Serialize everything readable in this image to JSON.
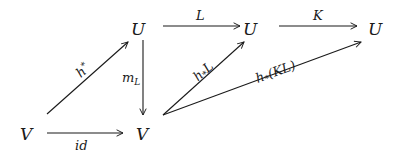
{
  "diagram": {
    "type": "commutative-diagram",
    "nodes": {
      "U_left": "𝒰",
      "U_mid": "𝒰",
      "U_right": "𝒰",
      "V_left": "𝒱",
      "V_mid": "𝒱"
    },
    "node_fallback": {
      "U": "U",
      "V": "V"
    },
    "arrows": {
      "h_star": {
        "from": "V_left",
        "to": "U_left",
        "label": "h",
        "sup": "*"
      },
      "m_L": {
        "from": "U_left",
        "to": "V_mid",
        "label": "m",
        "sub": "L"
      },
      "L": {
        "from": "U_left",
        "to": "U_mid",
        "label": "L"
      },
      "K": {
        "from": "U_mid",
        "to": "U_right",
        "label": "K"
      },
      "h_L": {
        "from": "V_mid",
        "to": "U_mid",
        "label": "h",
        "sub": "*",
        "tail": "L"
      },
      "h_KL": {
        "from": "V_mid",
        "to": "U_right",
        "label": "h",
        "sub": "*",
        "tail": "(KL)"
      },
      "id": {
        "from": "V_left",
        "to": "V_mid",
        "label": "id"
      }
    }
  }
}
